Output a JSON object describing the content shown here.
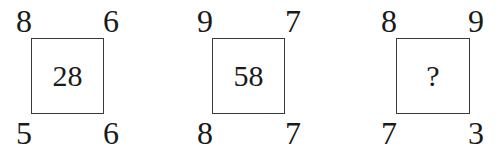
{
  "puzzle": {
    "panels": [
      {
        "top_left": "8",
        "top_right": "6",
        "bottom_left": "5",
        "bottom_right": "6",
        "center": "28"
      },
      {
        "top_left": "9",
        "top_right": "7",
        "bottom_left": "8",
        "bottom_right": "7",
        "center": "58"
      },
      {
        "top_left": "8",
        "top_right": "9",
        "bottom_left": "7",
        "bottom_right": "3",
        "center": "?"
      }
    ]
  }
}
